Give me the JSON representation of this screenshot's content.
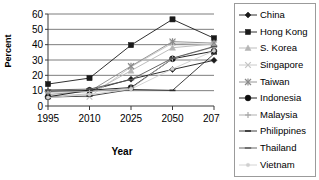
{
  "chart_data": {
    "type": "line",
    "title": "",
    "xlabel": "Year",
    "ylabel": "Percent",
    "categories": [
      "1995",
      "2010",
      "2025",
      "2050",
      "2075"
    ],
    "x": [
      1995,
      2010,
      2025,
      2050,
      2075
    ],
    "ylim": [
      0,
      60
    ],
    "ytick_labels": [
      "0",
      "10",
      "20",
      "30",
      "40",
      "50",
      "60"
    ],
    "yticks": [
      0,
      10,
      20,
      30,
      40,
      50,
      60
    ],
    "grid": "horizontal",
    "legend_position": "right",
    "series": [
      {
        "name": "China",
        "marker": "diamond",
        "color": "#1a1a1a",
        "values": [
          9.5,
          10.0,
          17.5,
          23.8,
          29.8
        ]
      },
      {
        "name": "Hong Kong",
        "marker": "square",
        "color": "#1a1a1a",
        "values": [
          14.3,
          18.2,
          39.7,
          56.5,
          44.2
        ]
      },
      {
        "name": "S. Korea",
        "marker": "triangle",
        "color": "#b5b5b5",
        "values": [
          6.0,
          8.0,
          23.0,
          38.0,
          40.5
        ]
      },
      {
        "name": "Singapore",
        "marker": "x",
        "color": "#c4c4c4",
        "values": [
          6.5,
          6.0,
          25.5,
          41.0,
          40.0
        ]
      },
      {
        "name": "Taiwan",
        "marker": "star",
        "color": "#8a8a8a",
        "values": [
          7.5,
          9.5,
          26.0,
          42.0,
          41.0
        ]
      },
      {
        "name": "Indonesia",
        "marker": "circle",
        "color": "#0d0d0d",
        "values": [
          6.0,
          10.3,
          12.0,
          30.8,
          35.8
        ]
      },
      {
        "name": "Malaysia",
        "marker": "plus",
        "color": "#a8a8a8",
        "values": [
          9.0,
          9.5,
          11.5,
          31.0,
          38.5
        ]
      },
      {
        "name": "Philippines",
        "marker": "dash",
        "color": "#2b2b2b",
        "values": [
          5.8,
          6.5,
          10.8,
          10.2,
          34.0
        ]
      },
      {
        "name": "Thailand",
        "marker": "line",
        "color": "#555555",
        "values": [
          10.5,
          11.0,
          17.2,
          31.2,
          38.8
        ]
      },
      {
        "name": "Vietnam",
        "marker": "dot",
        "color": "#cfcfcf",
        "values": [
          5.5,
          7.5,
          11.0,
          24.2,
          36.0
        ]
      }
    ]
  },
  "legend": {
    "items": [
      {
        "label": "China"
      },
      {
        "label": "Hong Kong"
      },
      {
        "label": "S. Korea"
      },
      {
        "label": "Singapore"
      },
      {
        "label": "Taiwan"
      },
      {
        "label": "Indonesia"
      },
      {
        "label": "Malaysia"
      },
      {
        "label": "Philippines"
      },
      {
        "label": "Thailand"
      },
      {
        "label": "Vietnam"
      }
    ]
  }
}
